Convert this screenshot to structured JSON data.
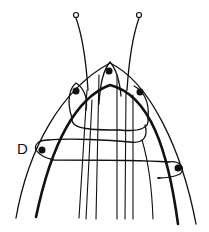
{
  "diagram": {
    "labels": {
      "d": "D"
    },
    "stroke_color": "#111111",
    "background": "#ffffff"
  }
}
